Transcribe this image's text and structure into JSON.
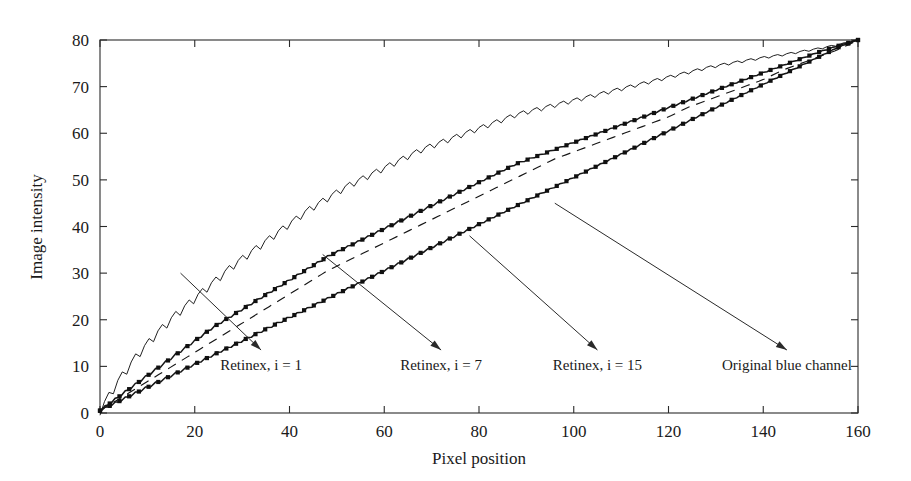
{
  "chart_data": {
    "type": "line",
    "title": "",
    "xlabel": "Pixel position",
    "ylabel": "Image intensity",
    "xlim": [
      0,
      160
    ],
    "ylim": [
      0,
      80
    ],
    "xticks": [
      0,
      20,
      40,
      60,
      80,
      100,
      120,
      140,
      160
    ],
    "yticks": [
      0,
      10,
      20,
      30,
      40,
      50,
      60,
      70,
      80
    ],
    "grid": false,
    "legend_position": "inline-annotations",
    "x": [
      0,
      4,
      8,
      12,
      16,
      20,
      24,
      28,
      32,
      36,
      40,
      44,
      48,
      52,
      56,
      60,
      64,
      68,
      72,
      76,
      80,
      84,
      88,
      92,
      96,
      100,
      104,
      108,
      112,
      116,
      120,
      124,
      128,
      132,
      136,
      140,
      144,
      148,
      152,
      156,
      160
    ],
    "series": [
      {
        "name": "Retinex, i = 1",
        "style": "thin-jagged",
        "marker": "none",
        "values": [
          0.5,
          7.0,
          12.5,
          17.0,
          21.0,
          24.5,
          28.0,
          31.5,
          34.5,
          37.5,
          40.5,
          43.5,
          46.0,
          48.5,
          50.5,
          52.5,
          54.5,
          56.5,
          58.0,
          59.5,
          61.0,
          62.5,
          64.0,
          65.0,
          66.0,
          67.0,
          68.0,
          69.0,
          70.0,
          71.0,
          72.0,
          73.0,
          74.0,
          74.8,
          75.5,
          76.2,
          76.8,
          77.5,
          78.2,
          79.0,
          80.0
        ]
      },
      {
        "name": "Retinex, i = 7",
        "style": "marker-line",
        "marker": "square",
        "values": [
          0.5,
          3.5,
          6.5,
          9.5,
          12.5,
          15.5,
          18.5,
          21.0,
          23.5,
          26.0,
          28.5,
          31.0,
          33.5,
          35.5,
          37.5,
          39.5,
          41.5,
          43.5,
          45.5,
          47.5,
          49.5,
          51.5,
          53.5,
          55.0,
          56.5,
          58.0,
          59.5,
          61.0,
          62.5,
          64.0,
          65.5,
          67.0,
          68.5,
          70.0,
          71.5,
          73.0,
          74.5,
          76.0,
          77.5,
          78.8,
          80.0
        ]
      },
      {
        "name": "Retinex, i = 15",
        "style": "dashed",
        "marker": "none",
        "values": [
          0.5,
          3.0,
          5.5,
          8.0,
          10.5,
          13.0,
          15.5,
          18.0,
          20.5,
          23.0,
          25.5,
          28.0,
          30.5,
          32.5,
          34.5,
          36.5,
          38.5,
          40.5,
          42.5,
          44.5,
          46.5,
          48.5,
          50.5,
          52.5,
          54.5,
          56.0,
          57.5,
          59.0,
          60.5,
          62.0,
          63.5,
          65.5,
          67.0,
          68.5,
          70.0,
          71.5,
          73.5,
          75.0,
          76.5,
          78.0,
          80.0
        ]
      },
      {
        "name": "Original blue channel",
        "style": "marker-line",
        "marker": "square",
        "values": [
          0.5,
          2.5,
          4.5,
          6.5,
          8.5,
          10.5,
          12.5,
          14.5,
          16.5,
          18.5,
          20.5,
          22.5,
          24.5,
          26.5,
          28.5,
          30.5,
          32.5,
          34.5,
          36.5,
          38.5,
          40.5,
          42.5,
          44.5,
          46.5,
          48.5,
          50.5,
          52.5,
          54.5,
          56.5,
          58.5,
          60.5,
          62.5,
          64.5,
          66.5,
          68.5,
          70.5,
          72.5,
          74.5,
          76.5,
          78.5,
          80.0
        ]
      }
    ],
    "annotations": [
      {
        "label": "Retinex, i = 1",
        "label_x": 34,
        "label_y": 10.5,
        "point_x": 17,
        "point_y": 30
      },
      {
        "label": "Retinex, i = 7",
        "label_x": 72,
        "label_y": 10.5,
        "point_x": 47,
        "point_y": 34
      },
      {
        "label": "Retinex, i = 15",
        "label_x": 105,
        "label_y": 10.5,
        "point_x": 78,
        "point_y": 38
      },
      {
        "label": "Original blue channel",
        "label_x": 145,
        "label_y": 10.5,
        "point_x": 96,
        "point_y": 45
      }
    ]
  },
  "colors": {
    "axis": "#2a2a2a",
    "curve": "#151515",
    "background": "#ffffff"
  }
}
